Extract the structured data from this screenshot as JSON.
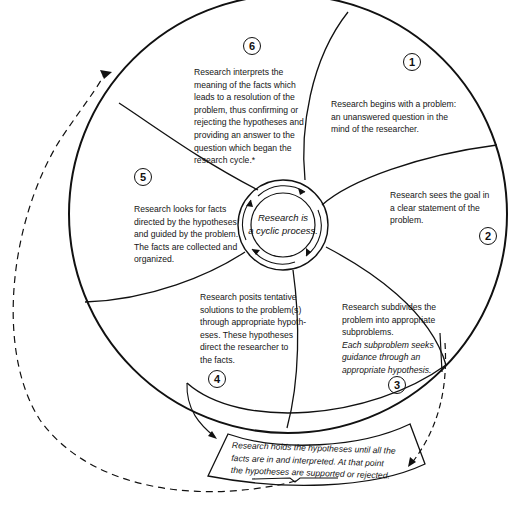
{
  "diagram": {
    "center": {
      "lines": [
        "Research is",
        "a cyclic process."
      ]
    },
    "steps": [
      {
        "number": "1",
        "lines": [
          "Research begins with a problem:",
          "an unanswered question in the",
          "mind of the researcher."
        ]
      },
      {
        "number": "2",
        "lines": [
          "Research sees the goal in",
          "a clear statement of the",
          "problem."
        ]
      },
      {
        "number": "3",
        "lines": [
          "Research subdivides the",
          "problem into appropriate",
          "subproblems."
        ],
        "italic_lines": [
          "Each subproblem seeks",
          "guidance through an",
          "appropriate hypothesis."
        ]
      },
      {
        "number": "4",
        "lines": [
          "Research posits tentative",
          "solutions to the problem(s)",
          "through appropriate hypoth-",
          "eses.  These hypotheses",
          "direct the researcher to",
          "the facts."
        ]
      },
      {
        "number": "5",
        "lines": [
          "Research looks for facts",
          "directed by the hypotheses",
          "and guided by the problem.",
          "The facts are collected and",
          "organized."
        ]
      },
      {
        "number": "6",
        "lines": [
          "Research interprets the",
          "meaning of the facts which",
          "leads to a resolution of the",
          "problem, thus confirming or",
          "rejecting the hypotheses and",
          "providing an answer to the",
          "question which began the",
          "research cycle.*"
        ]
      }
    ],
    "hold_box": {
      "lines": [
        "Research holds the hypotheses until all the",
        "facts are in and interpreted.  At that point",
        "the hypotheses are supported or rejected."
      ]
    },
    "colors": {
      "ink": "#111111",
      "background": "#ffffff"
    }
  }
}
